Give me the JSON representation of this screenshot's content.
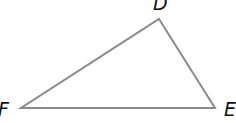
{
  "diagram": {
    "type": "triangle",
    "stroke_color": "#8a8a8a",
    "stroke_width": 2,
    "vertices": [
      {
        "label": "D",
        "x": 159,
        "y": 19
      },
      {
        "label": "E",
        "x": 215,
        "y": 108
      },
      {
        "label": "F",
        "x": 21,
        "y": 108
      }
    ],
    "labels": {
      "d": "D",
      "e": "E",
      "f": "F"
    }
  }
}
